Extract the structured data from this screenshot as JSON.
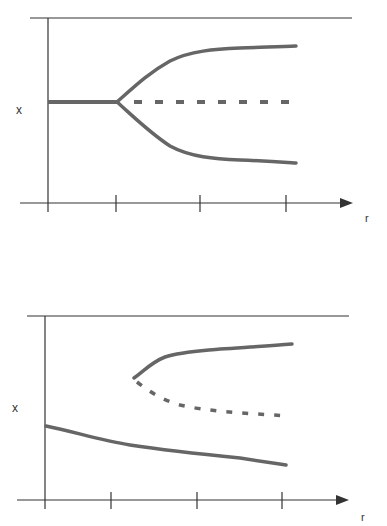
{
  "colors": {
    "axis": "#333333",
    "curve": "#666666",
    "background": "#ffffff"
  },
  "diagrams": [
    {
      "name": "pitchfork-bifurcation",
      "x_label": "x",
      "r_label": "r",
      "branches": [
        {
          "name": "stable-trivial-before",
          "style": "solid"
        },
        {
          "name": "unstable-trivial-after",
          "style": "dashed"
        },
        {
          "name": "upper-stable-branch",
          "style": "solid"
        },
        {
          "name": "lower-stable-branch",
          "style": "solid"
        }
      ],
      "ticks": 4
    },
    {
      "name": "imperfect-bifurcation",
      "x_label": "x",
      "r_label": "r",
      "branches": [
        {
          "name": "upper-stable-branch",
          "style": "solid"
        },
        {
          "name": "unstable-branch",
          "style": "dashed"
        },
        {
          "name": "lower-stable-branch",
          "style": "solid"
        }
      ],
      "ticks": 4
    }
  ]
}
